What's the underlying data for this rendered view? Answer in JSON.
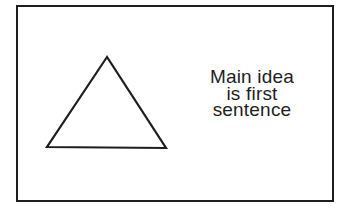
{
  "diagram": {
    "frame": {
      "stroke_color": "#1e1e1e",
      "fill_color": "#ffffff"
    },
    "shape": {
      "type": "triangle",
      "icon": "triangle-outline",
      "stroke_color": "#1e1e1e"
    },
    "caption": {
      "lines": [
        "Main idea",
        "is first",
        "sentence"
      ]
    }
  }
}
